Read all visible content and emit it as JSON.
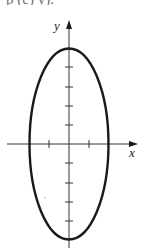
{
  "header": {
    "cropped_text": "p   (c)      y)."
  },
  "figure": {
    "x_label": "x",
    "y_label": "y",
    "colors": {
      "stroke": "#1a1a1a",
      "background": "#ffffff"
    },
    "ellipse": {
      "semi_axis_x": 2,
      "semi_axis_y": 5,
      "center": [
        0,
        0
      ]
    },
    "x_ticks": [
      -2,
      -1,
      1,
      2
    ],
    "y_ticks": [
      -5,
      -4,
      -3,
      -2,
      -1,
      1,
      2,
      3,
      4,
      5
    ]
  }
}
